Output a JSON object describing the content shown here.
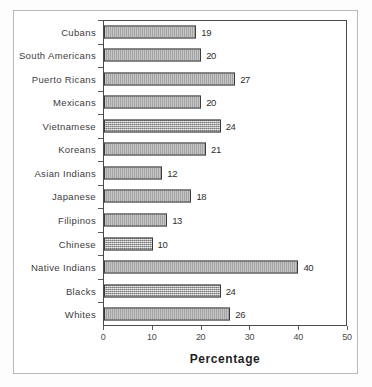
{
  "chart_data": {
    "type": "bar",
    "orientation": "horizontal",
    "title": "",
    "xlabel": "Percentage",
    "ylabel": "",
    "xlim": [
      0,
      50
    ],
    "xticks": [
      0,
      10,
      20,
      30,
      40,
      50
    ],
    "grid": false,
    "legend": null,
    "categories": [
      "Cubans",
      "South Americans",
      "Puerto Ricans",
      "Mexicans",
      "Vietnamese",
      "Koreans",
      "Asian Indians",
      "Japanese",
      "Filipinos",
      "Chinese",
      "Native Indians",
      "Blacks",
      "Whites"
    ],
    "values": [
      19,
      20,
      27,
      20,
      24,
      21,
      12,
      18,
      13,
      10,
      40,
      24,
      26
    ],
    "data_labels": [
      "19",
      "20",
      "27",
      "20",
      "24",
      "21",
      "12",
      "18",
      "13",
      "10",
      "40",
      "24",
      "26"
    ],
    "tick_labels": [
      "0",
      "10",
      "20",
      "30",
      "40",
      "50"
    ],
    "bar_color": "#a8a8a8",
    "bar_border_color": "#3a3a3a",
    "axis_color": "#4a4a4a"
  }
}
